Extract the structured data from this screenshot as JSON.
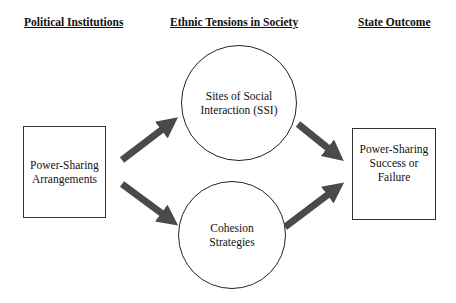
{
  "headers": {
    "political": "Political Institutions",
    "ethnic": "Ethnic Tensions in Society",
    "state": "State Outcome"
  },
  "nodes": {
    "power_sharing": "Power-Sharing\nArrangements",
    "ssi": "Sites of Social\nInteraction (SSI)",
    "cohesion": "Cohesion\nStrategies",
    "outcome": "Power-Sharing\nSuccess or\nFailure"
  },
  "edges": [
    {
      "from": "power_sharing",
      "to": "ssi"
    },
    {
      "from": "power_sharing",
      "to": "cohesion"
    },
    {
      "from": "ssi",
      "to": "outcome"
    },
    {
      "from": "cohesion",
      "to": "outcome"
    }
  ],
  "colors": {
    "arrow": "#4a4a4a",
    "border": "#333333"
  }
}
